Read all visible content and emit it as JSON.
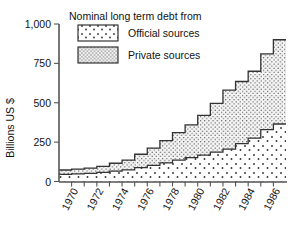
{
  "chart_data": {
    "type": "area",
    "subtype": "stacked-step-area",
    "title": "",
    "xlabel": "",
    "ylabel": "Billions US $",
    "ylim": [
      0,
      1000
    ],
    "yticks": [
      0,
      250,
      500,
      750,
      1000
    ],
    "ytick_labels": [
      "0",
      "250",
      "500",
      "750",
      "1,000"
    ],
    "xlim": [
      1969,
      1987
    ],
    "x": [
      1969,
      1970,
      1971,
      1972,
      1973,
      1974,
      1975,
      1976,
      1977,
      1978,
      1979,
      1980,
      1981,
      1982,
      1983,
      1984,
      1985,
      1986
    ],
    "xticks": [
      1970,
      1971,
      1972,
      1973,
      1974,
      1975,
      1976,
      1977,
      1978,
      1979,
      1980,
      1981,
      1982,
      1983,
      1984,
      1985,
      1986
    ],
    "xtick_labels_shown": [
      "1970",
      "1972",
      "1974",
      "1976",
      "1978",
      "1980",
      "1982",
      "1984",
      "1986"
    ],
    "grid": false,
    "legend_position": "upper-left-inside",
    "legend_title": "Nominal long term debt from",
    "series": [
      {
        "name": "Official sources",
        "pattern": "sparse-dots",
        "values": [
          45,
          48,
          52,
          58,
          66,
          74,
          88,
          102,
          118,
          136,
          152,
          168,
          186,
          205,
          240,
          275,
          330,
          365
        ]
      },
      {
        "name": "Private sources",
        "pattern": "dense-dots",
        "values": [
          28,
          30,
          33,
          38,
          50,
          62,
          85,
          110,
          142,
          174,
          208,
          252,
          310,
          375,
          395,
          425,
          480,
          535
        ]
      }
    ],
    "totals": [
      73,
      78,
      85,
      96,
      116,
      136,
      173,
      212,
      260,
      310,
      360,
      420,
      496,
      580,
      635,
      700,
      810,
      900
    ]
  },
  "colors": {
    "axis": "#555555",
    "outline": "#333333",
    "text": "#111111",
    "background": "#ffffff",
    "official_fill": "#ffffff",
    "private_fill": "#f2f2f2"
  },
  "legend": {
    "title": "Nominal long term debt from",
    "items": [
      {
        "label": "Official sources",
        "swatch": "sparse-dots-swatch"
      },
      {
        "label": "Private sources",
        "swatch": "dense-dots-swatch"
      }
    ]
  },
  "axes": {
    "y_title": "Billions US $"
  }
}
